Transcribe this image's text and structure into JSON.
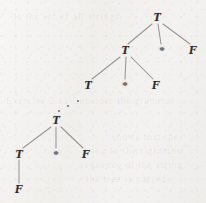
{
  "figure": {
    "name": "parse-tree-derivation",
    "width": 206,
    "height": 203,
    "ink_color": "#2e2c2b",
    "edge_color": "#8c8a89",
    "paper_color": "#f1efec"
  },
  "nodes": [
    {
      "id": "n0",
      "label": "T",
      "kind": "nonterminal",
      "x": 157,
      "y": 17,
      "level": 0
    },
    {
      "id": "n1",
      "label": "T",
      "kind": "nonterminal",
      "x": 125,
      "y": 50,
      "level": 1
    },
    {
      "id": "n2",
      "label": "*",
      "kind": "terminal",
      "x": 162,
      "y": 50,
      "level": 1
    },
    {
      "id": "n3",
      "label": "F",
      "kind": "nonterminal",
      "x": 193,
      "y": 50,
      "level": 1
    },
    {
      "id": "n4",
      "label": "T",
      "kind": "nonterminal",
      "x": 88,
      "y": 85,
      "level": 2
    },
    {
      "id": "n5",
      "label": "*",
      "kind": "terminal",
      "x": 125,
      "y": 85,
      "level": 2
    },
    {
      "id": "n6",
      "label": "F",
      "kind": "nonterminal",
      "x": 156,
      "y": 85,
      "level": 2
    },
    {
      "id": "n7",
      "label": "T",
      "kind": "nonterminal",
      "x": 56,
      "y": 120,
      "level": 4
    },
    {
      "id": "n8",
      "label": "T",
      "kind": "nonterminal",
      "x": 19,
      "y": 154,
      "level": 5
    },
    {
      "id": "n9",
      "label": "*",
      "kind": "terminal",
      "x": 56,
      "y": 154,
      "level": 5
    },
    {
      "id": "n10",
      "label": "F",
      "kind": "nonterminal",
      "x": 86,
      "y": 154,
      "level": 5
    },
    {
      "id": "n11",
      "label": "F",
      "kind": "nonterminal",
      "x": 19,
      "y": 189,
      "level": 6
    }
  ],
  "edges": [
    {
      "from": "n0",
      "to": "n1",
      "x1": 152,
      "y1": 24,
      "x2": 128,
      "y2": 44
    },
    {
      "from": "n0",
      "to": "n2",
      "x1": 158,
      "y1": 24,
      "x2": 161,
      "y2": 44
    },
    {
      "from": "n0",
      "to": "n3",
      "x1": 163,
      "y1": 24,
      "x2": 190,
      "y2": 44
    },
    {
      "from": "n1",
      "to": "n4",
      "x1": 120,
      "y1": 57,
      "x2": 92,
      "y2": 79
    },
    {
      "from": "n1",
      "to": "n5",
      "x1": 126,
      "y1": 57,
      "x2": 125,
      "y2": 79
    },
    {
      "from": "n1",
      "to": "n6",
      "x1": 131,
      "y1": 57,
      "x2": 153,
      "y2": 79
    },
    {
      "from": "n7",
      "to": "n8",
      "x1": 51,
      "y1": 127,
      "x2": 23,
      "y2": 148
    },
    {
      "from": "n7",
      "to": "n9",
      "x1": 56,
      "y1": 127,
      "x2": 56,
      "y2": 148
    },
    {
      "from": "n7",
      "to": "n10",
      "x1": 61,
      "y1": 127,
      "x2": 83,
      "y2": 148
    },
    {
      "from": "n8",
      "to": "n11",
      "x1": 19,
      "y1": 160,
      "x2": 19,
      "y2": 183
    }
  ],
  "ellipsis_dots": [
    {
      "x": 59,
      "y": 111
    },
    {
      "x": 68,
      "y": 106
    },
    {
      "x": 78,
      "y": 101
    }
  ],
  "ghost_text": [
    {
      "id": "g1",
      "text": "is the set of all strings",
      "x": 14,
      "y": 12,
      "size": 9.5
    },
    {
      "id": "g2",
      "text": "Exercise 2.11 Consider the grammar",
      "x": 6,
      "y": 96,
      "size": 9.5
    },
    {
      "id": "g3",
      "text": "shows that the",
      "x": 112,
      "y": 132,
      "size": 9.5
    },
    {
      "id": "g4",
      "text": "ing to the rightmost",
      "x": 92,
      "y": 146,
      "size": 9.5
    },
    {
      "id": "g5",
      "text": "sequence of the string",
      "x": 80,
      "y": 160,
      "size": 9.5
    },
    {
      "id": "g6",
      "text": "the tree is parsed",
      "x": 86,
      "y": 174,
      "size": 9.5
    }
  ]
}
